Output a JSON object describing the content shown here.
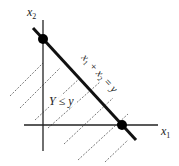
{
  "diagram": {
    "type": "region-plot",
    "axes": {
      "x_label": "x",
      "x_label_sub": "1",
      "y_label": "x",
      "y_label_sub": "2"
    },
    "line_label": "x₁ + x₂ = y",
    "line_label_parts": [
      "x",
      "1",
      " + x",
      "2",
      " = y"
    ],
    "region_label": "Y ≤ y",
    "points": [
      {
        "name": "y-intercept",
        "x": 0,
        "y": "y"
      },
      {
        "name": "x-intercept",
        "x": "y",
        "y": 0
      }
    ],
    "colors": {
      "line": "#111111",
      "axis": "#222222",
      "hatch": "#555555",
      "point": "#000000"
    }
  }
}
